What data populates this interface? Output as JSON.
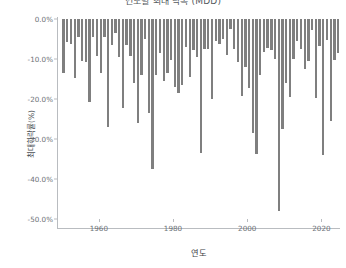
{
  "chart_data": {
    "type": "bar",
    "title": "연도별 최대 낙폭 (MDD)",
    "xlabel": "연도",
    "ylabel": "최대하락률(%)",
    "ylim": [
      -50.0,
      0.0
    ],
    "xlim": [
      1949.0,
      2025.0
    ],
    "ytick_labels": [
      "0.0%",
      "-10.0%",
      "-20.0%",
      "-30.0%",
      "-40.0%",
      "-50.0%"
    ],
    "ytick_values": [
      0.0,
      -10.0,
      -20.0,
      -30.0,
      -40.0,
      -50.0
    ],
    "xtick_labels": [
      "1960",
      "1980",
      "2000",
      "2020"
    ],
    "xtick_values": [
      1960,
      1980,
      2000,
      2020
    ],
    "grid": false,
    "legend": null,
    "bar_color": "#7f7f7f",
    "categories": [
      1950,
      1951,
      1952,
      1953,
      1954,
      1955,
      1956,
      1957,
      1958,
      1959,
      1960,
      1961,
      1962,
      1963,
      1964,
      1965,
      1966,
      1967,
      1968,
      1969,
      1970,
      1971,
      1972,
      1973,
      1974,
      1975,
      1976,
      1977,
      1978,
      1979,
      1980,
      1981,
      1982,
      1983,
      1984,
      1985,
      1986,
      1987,
      1988,
      1989,
      1990,
      1991,
      1992,
      1993,
      1994,
      1995,
      1996,
      1997,
      1998,
      1999,
      2000,
      2001,
      2002,
      2003,
      2004,
      2005,
      2006,
      2007,
      2008,
      2009,
      2010,
      2011,
      2012,
      2013,
      2014,
      2015,
      2016,
      2017,
      2018,
      2019,
      2020,
      2021,
      2022,
      2023,
      2024
    ],
    "values": [
      -13.6,
      -5.8,
      -6.2,
      -14.8,
      -4.4,
      -10.6,
      -10.8,
      -20.7,
      -4.4,
      -9.2,
      -13.4,
      -4.4,
      -26.9,
      -6.5,
      -3.5,
      -9.6,
      -22.2,
      -6.6,
      -9.3,
      -16.1,
      -25.9,
      -13.9,
      -5.1,
      -23.4,
      -37.6,
      -14.1,
      -8.4,
      -15.6,
      -13.6,
      -10.2,
      -17.1,
      -18.4,
      -16.6,
      -6.9,
      -14.4,
      -7.7,
      -9.4,
      -33.5,
      -7.6,
      -7.6,
      -19.9,
      -5.6,
      -6.2,
      -5.0,
      -8.9,
      -2.5,
      -7.6,
      -10.8,
      -19.3,
      -12.1,
      -17.2,
      -28.5,
      -33.8,
      -14.1,
      -8.2,
      -7.2,
      -7.7,
      -10.1,
      -48.0,
      -27.6,
      -16.0,
      -19.4,
      -9.9,
      -5.6,
      -7.4,
      -12.4,
      -10.5,
      -2.8,
      -19.8,
      -6.8,
      -33.9,
      -5.2,
      -25.4,
      -10.3,
      -8.5
    ]
  }
}
